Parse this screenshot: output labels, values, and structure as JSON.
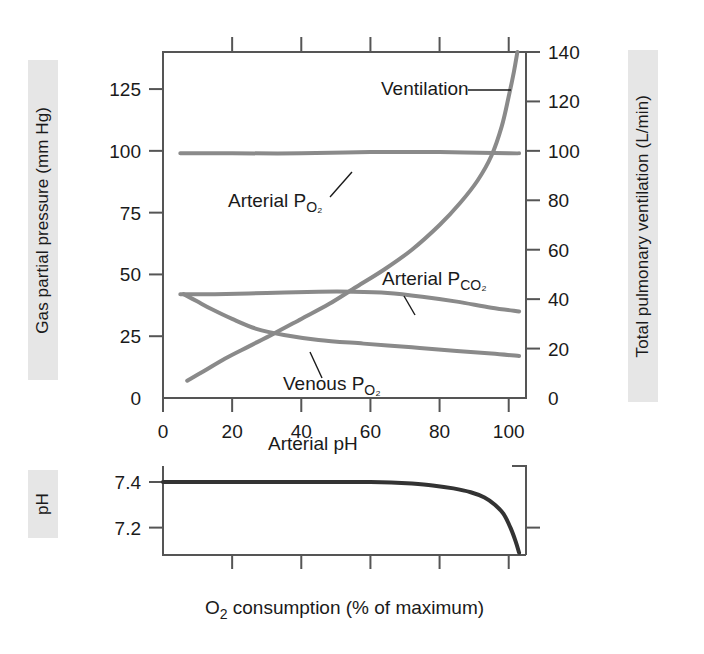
{
  "chart_data": {
    "type": "line",
    "title": "",
    "xlabel": "O₂ consumption (% of maximum)",
    "xlim": [
      0,
      105
    ],
    "xticks": [
      0,
      20,
      40,
      60,
      80,
      100
    ],
    "xticklabels": [
      "0",
      "20",
      "40",
      "60",
      "80",
      "100"
    ],
    "panels": [
      {
        "name": "gas-panel",
        "ylabel_left": "Gas partial pressure (mm Hg)",
        "ylabel_right": "Total pulmonary ventilation (L/min)",
        "ylim_left": [
          0,
          140
        ],
        "yticks_left": [
          0,
          25,
          50,
          75,
          100,
          125
        ],
        "yticklabels_left": [
          "0",
          "25",
          "50",
          "75",
          "100",
          "125"
        ],
        "ylim_right": [
          0,
          140
        ],
        "yticks_right": [
          0,
          20,
          40,
          60,
          80,
          100,
          120,
          140
        ],
        "yticklabels_right": [
          "0",
          "20",
          "40",
          "60",
          "80",
          "100",
          "120",
          "140"
        ],
        "grid": false,
        "series": [
          {
            "name": "Ventilation",
            "label": "Ventilation",
            "axis": "right",
            "color": "#8a8a8a",
            "width": 4,
            "x": [
              7,
              12,
              18,
              25,
              32,
              40,
              48,
              56,
              64,
              72,
              80,
              86,
              91,
              95,
              98,
              100,
              101.5,
              102.5
            ],
            "y": [
              7,
              11,
              16,
              21,
              26,
              32,
              38,
              45,
              52,
              60,
              70,
              79,
              88,
              98,
              110,
              122,
              132,
              140
            ]
          },
          {
            "name": "Arterial PO2",
            "label": "Arterial P",
            "label_sub": "O₂",
            "axis": "left",
            "color": "#8a8a8a",
            "width": 4,
            "x": [
              5,
              20,
              40,
              60,
              80,
              100,
              103
            ],
            "y": [
              99,
              99,
              99,
              99.5,
              99.5,
              99,
              99
            ]
          },
          {
            "name": "Arterial PCO2",
            "label": "Arterial P",
            "label_sub": "CO₂",
            "axis": "left",
            "color": "#8a8a8a",
            "width": 4,
            "x": [
              5,
              15,
              30,
              45,
              55,
              65,
              75,
              85,
              95,
              103
            ],
            "y": [
              42,
              42,
              42.5,
              43,
              43,
              42.5,
              41,
              39,
              36.5,
              35
            ]
          },
          {
            "name": "Venous PO2",
            "label": "Venous P",
            "label_sub": "O₂",
            "axis": "left",
            "color": "#8a8a8a",
            "width": 4,
            "x": [
              6,
              10,
              14,
              20,
              27,
              35,
              45,
              58,
              72,
              85,
              95,
              103
            ],
            "y": [
              42,
              39,
              36,
              32,
              28,
              25.5,
              23.5,
              22,
              20.5,
              19,
              18,
              17
            ]
          }
        ],
        "annotations": [
          {
            "name": "ventilation-label",
            "text": "Ventilation",
            "x_px": 381,
            "y_px": 95,
            "leader": [
              [
                468,
                90
              ],
              [
                511,
                90
              ]
            ]
          },
          {
            "name": "arterial-po2-label",
            "text": "Arterial P",
            "sub": "O₂",
            "x_px": 228,
            "y_px": 207,
            "leader": [
              [
                330,
                197
              ],
              [
                352,
                172
              ]
            ]
          },
          {
            "name": "arterial-pco2-label",
            "text": "Arterial P",
            "sub": "CO₂",
            "x_px": 382,
            "y_px": 285,
            "leader": [
              [
                404,
                296
              ],
              [
                415,
                315
              ]
            ]
          },
          {
            "name": "venous-po2-label",
            "text": "Venous P",
            "sub": "O₂",
            "x_px": 283,
            "y_px": 390,
            "leader": [
              [
                322,
                378
              ],
              [
                310,
                352
              ]
            ]
          }
        ]
      },
      {
        "name": "ph-panel",
        "ylabel_left": "pH",
        "ylim_left": [
          7.08,
          7.47
        ],
        "yticks_left": [
          7.2,
          7.4
        ],
        "yticklabels_left": [
          "7.2",
          "7.4"
        ],
        "grid": false,
        "series": [
          {
            "name": "Arterial pH",
            "label": "Arterial pH",
            "axis": "left",
            "color": "#333333",
            "width": 4,
            "x": [
              0,
              10,
              20,
              30,
              40,
              50,
              60,
              66,
              72,
              78,
              84,
              89,
              93,
              96,
              98.5,
              100.5,
              102,
              103
            ],
            "y": [
              7.4,
              7.4,
              7.4,
              7.4,
              7.4,
              7.4,
              7.4,
              7.398,
              7.393,
              7.385,
              7.372,
              7.355,
              7.332,
              7.3,
              7.26,
              7.2,
              7.14,
              7.09
            ]
          }
        ],
        "annotations": [
          {
            "name": "arterial-ph-label",
            "text": "Arterial pH",
            "x_px": 268,
            "y_px": 450,
            "leader": null
          }
        ]
      }
    ]
  },
  "colors": {
    "curve_gray": "#8a8a8a",
    "curve_dark": "#333333",
    "band_bg": "#e6e6e6",
    "spine": "#555555",
    "text": "#1a1a1a"
  }
}
